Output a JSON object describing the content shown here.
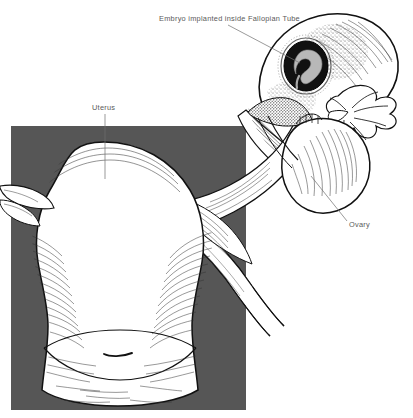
{
  "figure": {
    "style": "black-and-white line drawing with stipple and hatching",
    "canvas": {
      "width": 413,
      "height": 418,
      "background": "#ffffff"
    },
    "backdrop_panel": {
      "name": "gray-background-panel",
      "color": "#565656",
      "x": 11,
      "y": 126,
      "width": 235,
      "height": 284
    }
  },
  "labels": [
    {
      "id": "embryo",
      "text": "Embryo implanted inside Fallopian Tube",
      "x": 159,
      "y": 21,
      "anchor": "start",
      "leader": {
        "x1": 228,
        "y1": 25,
        "x2": 300,
        "y2": 63
      }
    },
    {
      "id": "uterus",
      "text": "Uterus",
      "x": 92,
      "y": 110,
      "anchor": "start",
      "leader": {
        "x1": 105,
        "y1": 114,
        "x2": 105,
        "y2": 179
      }
    },
    {
      "id": "ovary",
      "text": "Ovary",
      "x": 349,
      "y": 227,
      "anchor": "start",
      "leader": {
        "x1": 311,
        "y1": 176,
        "x2": 347,
        "y2": 221
      }
    }
  ],
  "anatomy": {
    "uterus": {
      "name": "uterus-body",
      "description": "large pear-shaped uterine corpus with fundus dome and cervix below"
    },
    "cervix": {
      "name": "cervix",
      "description": "lower narrowed segment with external os slit"
    },
    "right_tube": {
      "name": "right-fallopian-tube",
      "description": "tube running up and to the right, dilated at the ampulla"
    },
    "left_tube": {
      "name": "left-fallopian-tube-stub",
      "description": "short tube stub exiting the left edge of the panel"
    },
    "ampulla": {
      "name": "tubal-ampulla",
      "description": "swollen distal tube containing the implanted embryo"
    },
    "embryo": {
      "name": "embryo",
      "description": "curled gray embryo inside a dark gestational sac",
      "sac_color": "#111111",
      "embryo_color": "#b8b8b8",
      "cx": 306,
      "cy": 66,
      "rx": 20,
      "ry": 23
    },
    "fimbriae": {
      "name": "fimbriae",
      "description": "finger-like fringe at the distal end of the tube"
    },
    "ovary": {
      "name": "ovary",
      "description": "rounded ovoid ovary beneath the fimbriae, right of the panel"
    },
    "broad_ligament": {
      "name": "broad-ligament",
      "description": "fan of mesosalpinx tissue with parallel hatching"
    }
  },
  "colors": {
    "ink": "#111111",
    "panel_gray": "#565656",
    "label_gray": "#5a5a5a",
    "leader_gray": "#6e6e6e",
    "organ_fill": "#ffffff",
    "stipple": "#222222"
  }
}
